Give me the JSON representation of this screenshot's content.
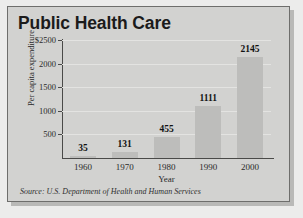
{
  "chart_data": {
    "type": "bar",
    "title": "Public Health Care",
    "xlabel": "Year",
    "ylabel": "Per capita expenditure",
    "categories": [
      "1960",
      "1970",
      "1980",
      "1990",
      "2000"
    ],
    "values": [
      35,
      131,
      455,
      1111,
      2145
    ],
    "value_labels": [
      "35",
      "131",
      "455",
      "1111",
      "2145"
    ],
    "ylim": [
      0,
      2500
    ],
    "yticks": [
      500,
      1000,
      1500,
      2000,
      2500
    ],
    "ytick_labels": [
      "500",
      "1000",
      "1500",
      "2000",
      "$2500"
    ],
    "grid": true,
    "legend": "none",
    "source": "Source: U.S. Department of Health and Human Services",
    "colors": {
      "bar": "#bdbdbb",
      "panel": "#d2d2d0",
      "border": "#6e6e6c",
      "axis": "#4a4a48",
      "grid": "#e3e3e1",
      "text": "#1b1b1b"
    }
  }
}
